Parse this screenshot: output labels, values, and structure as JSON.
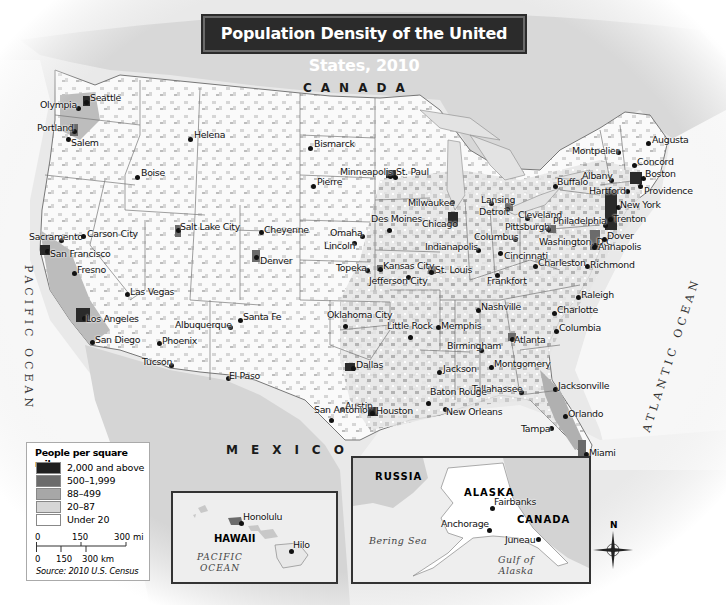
{
  "title": "Population Density of the United States, 2010",
  "countries": {
    "canada": "CANADA",
    "mexico": "MEXICO"
  },
  "oceans": {
    "pacific": "PACIFIC OCEAN",
    "atlantic": "ATLANTIC OCEAN"
  },
  "legend": {
    "title": "People per square mile",
    "items": [
      {
        "label": "2,000 and above",
        "color": "#1f1f1f"
      },
      {
        "label": "500–1,999",
        "color": "#6b6b6b"
      },
      {
        "label": "88–499",
        "color": "#a7a7a7"
      },
      {
        "label": "20–87",
        "color": "#d6d6d6"
      },
      {
        "label": "Under 20",
        "color": "#ffffff"
      }
    ],
    "scale_mi": [
      "0",
      "150",
      "300 mi"
    ],
    "scale_km": [
      "0",
      "150",
      "300 km"
    ],
    "source": "Source: 2010 U.S. Census"
  },
  "cities": [
    {
      "name": "Seattle",
      "x": 86,
      "y": 102,
      "lx": 90,
      "ly": 92
    },
    {
      "name": "Olympia",
      "x": 78,
      "y": 108,
      "lx": 40,
      "ly": 99
    },
    {
      "name": "Portland",
      "x": 74,
      "y": 131,
      "lx": 37,
      "ly": 122
    },
    {
      "name": "Salem",
      "x": 68,
      "y": 139,
      "lx": 71,
      "ly": 137
    },
    {
      "name": "Helena",
      "x": 190,
      "y": 139,
      "lx": 194,
      "ly": 129
    },
    {
      "name": "Boise",
      "x": 137,
      "y": 177,
      "lx": 141,
      "ly": 167
    },
    {
      "name": "Bismarck",
      "x": 310,
      "y": 148,
      "lx": 314,
      "ly": 138
    },
    {
      "name": "Pierre",
      "x": 313,
      "y": 186,
      "lx": 317,
      "ly": 176
    },
    {
      "name": "Minneapolis",
      "x": 390,
      "y": 176,
      "lx": 340,
      "ly": 166
    },
    {
      "name": "St. Paul",
      "x": 395,
      "y": 177,
      "lx": 396,
      "ly": 166
    },
    {
      "name": "Salt Lake City",
      "x": 178,
      "y": 230,
      "lx": 180,
      "ly": 221
    },
    {
      "name": "Sacramento",
      "x": 61,
      "y": 240,
      "lx": 29,
      "ly": 231
    },
    {
      "name": "Carson City",
      "x": 83,
      "y": 236,
      "lx": 87,
      "ly": 228
    },
    {
      "name": "San Francisco",
      "x": 47,
      "y": 251,
      "lx": 50,
      "ly": 248
    },
    {
      "name": "Fresno",
      "x": 74,
      "y": 273,
      "lx": 77,
      "ly": 264
    },
    {
      "name": "Cheyenne",
      "x": 261,
      "y": 232,
      "lx": 264,
      "ly": 224
    },
    {
      "name": "Denver",
      "x": 256,
      "y": 257,
      "lx": 260,
      "ly": 255
    },
    {
      "name": "Omaha",
      "x": 362,
      "y": 236,
      "lx": 330,
      "ly": 227
    },
    {
      "name": "Lincoln",
      "x": 354,
      "y": 243,
      "lx": 324,
      "ly": 240
    },
    {
      "name": "Des Moines",
      "x": 389,
      "y": 230,
      "lx": 371,
      "ly": 213
    },
    {
      "name": "Milwaukee",
      "x": 452,
      "y": 202,
      "lx": 408,
      "ly": 197
    },
    {
      "name": "Chicago",
      "x": 455,
      "y": 224,
      "lx": 422,
      "ly": 218
    },
    {
      "name": "Lansing",
      "x": 491,
      "y": 203,
      "lx": 481,
      "ly": 194
    },
    {
      "name": "Detroit",
      "x": 507,
      "y": 209,
      "lx": 479,
      "ly": 206
    },
    {
      "name": "Cleveland",
      "x": 527,
      "y": 218,
      "lx": 518,
      "ly": 209
    },
    {
      "name": "Buffalo",
      "x": 555,
      "y": 186,
      "lx": 557,
      "ly": 176
    },
    {
      "name": "Montpelier",
      "x": 618,
      "y": 152,
      "lx": 572,
      "ly": 145
    },
    {
      "name": "Augusta",
      "x": 648,
      "y": 143,
      "lx": 652,
      "ly": 134
    },
    {
      "name": "Concord",
      "x": 634,
      "y": 165,
      "lx": 637,
      "ly": 156
    },
    {
      "name": "Albany",
      "x": 611,
      "y": 180,
      "lx": 582,
      "ly": 170
    },
    {
      "name": "Boston",
      "x": 643,
      "y": 178,
      "lx": 645,
      "ly": 168
    },
    {
      "name": "Hartford",
      "x": 627,
      "y": 191,
      "lx": 589,
      "ly": 185
    },
    {
      "name": "Providence",
      "x": 640,
      "y": 186,
      "lx": 644,
      "ly": 185
    },
    {
      "name": "New York",
      "x": 618,
      "y": 207,
      "lx": 620,
      "ly": 199
    },
    {
      "name": "Trenton",
      "x": 610,
      "y": 219,
      "lx": 613,
      "ly": 213
    },
    {
      "name": "Philadelphia",
      "x": 605,
      "y": 225,
      "lx": 553,
      "ly": 215
    },
    {
      "name": "Pittsburgh",
      "x": 548,
      "y": 229,
      "lx": 505,
      "ly": 221
    },
    {
      "name": "Columbus",
      "x": 515,
      "y": 239,
      "lx": 474,
      "ly": 231
    },
    {
      "name": "Indianapolis",
      "x": 478,
      "y": 250,
      "lx": 425,
      "ly": 241
    },
    {
      "name": "Cincinnati",
      "x": 500,
      "y": 253,
      "lx": 504,
      "ly": 250
    },
    {
      "name": "Washington, D.C.",
      "x": 595,
      "y": 245,
      "lx": 539,
      "ly": 236
    },
    {
      "name": "Dover",
      "x": 604,
      "y": 239,
      "lx": 607,
      "ly": 230
    },
    {
      "name": "Annapolis",
      "x": 594,
      "y": 247,
      "lx": 598,
      "ly": 241
    },
    {
      "name": "Charleston",
      "x": 535,
      "y": 266,
      "lx": 538,
      "ly": 257
    },
    {
      "name": "Richmond",
      "x": 587,
      "y": 266,
      "lx": 590,
      "ly": 259
    },
    {
      "name": "Topeka",
      "x": 367,
      "y": 270,
      "lx": 336,
      "ly": 262
    },
    {
      "name": "Kansas City",
      "x": 380,
      "y": 269,
      "lx": 383,
      "ly": 260
    },
    {
      "name": "Jefferson City",
      "x": 408,
      "y": 277,
      "lx": 369,
      "ly": 275
    },
    {
      "name": "St. Louis",
      "x": 431,
      "y": 272,
      "lx": 435,
      "ly": 264
    },
    {
      "name": "Frankfort",
      "x": 497,
      "y": 275,
      "lx": 487,
      "ly": 275
    },
    {
      "name": "Las Vegas",
      "x": 127,
      "y": 294,
      "lx": 130,
      "ly": 286
    },
    {
      "name": "Santa Fe",
      "x": 240,
      "y": 320,
      "lx": 243,
      "ly": 311
    },
    {
      "name": "Albuquerque",
      "x": 230,
      "y": 327,
      "lx": 175,
      "ly": 319
    },
    {
      "name": "Los Angeles",
      "x": 84,
      "y": 318,
      "lx": 86,
      "ly": 313
    },
    {
      "name": "San Diego",
      "x": 92,
      "y": 342,
      "lx": 95,
      "ly": 334
    },
    {
      "name": "Phoenix",
      "x": 159,
      "y": 343,
      "lx": 162,
      "ly": 335
    },
    {
      "name": "Tucson",
      "x": 171,
      "y": 365,
      "lx": 142,
      "ly": 356
    },
    {
      "name": "El Paso",
      "x": 228,
      "y": 378,
      "lx": 229,
      "ly": 370
    },
    {
      "name": "Oklahoma City",
      "x": 345,
      "y": 326,
      "lx": 327,
      "ly": 309
    },
    {
      "name": "Little Rock",
      "x": 410,
      "y": 337,
      "lx": 387,
      "ly": 320
    },
    {
      "name": "Memphis",
      "x": 438,
      "y": 327,
      "lx": 441,
      "ly": 320
    },
    {
      "name": "Nashville",
      "x": 478,
      "y": 310,
      "lx": 481,
      "ly": 301
    },
    {
      "name": "Raleigh",
      "x": 578,
      "y": 297,
      "lx": 581,
      "ly": 289
    },
    {
      "name": "Charlotte",
      "x": 554,
      "y": 313,
      "lx": 557,
      "ly": 304
    },
    {
      "name": "Columbia",
      "x": 556,
      "y": 331,
      "lx": 559,
      "ly": 322
    },
    {
      "name": "Atlanta",
      "x": 512,
      "y": 339,
      "lx": 514,
      "ly": 334
    },
    {
      "name": "Birmingham",
      "x": 481,
      "y": 350,
      "lx": 447,
      "ly": 340
    },
    {
      "name": "Montgomery",
      "x": 491,
      "y": 367,
      "lx": 494,
      "ly": 358
    },
    {
      "name": "Jackson",
      "x": 439,
      "y": 372,
      "lx": 443,
      "ly": 363
    },
    {
      "name": "Dallas",
      "x": 353,
      "y": 368,
      "lx": 356,
      "ly": 359
    },
    {
      "name": "Tallahassee",
      "x": 521,
      "y": 392,
      "lx": 472,
      "ly": 383
    },
    {
      "name": "Jacksonville",
      "x": 555,
      "y": 389,
      "lx": 558,
      "ly": 380
    },
    {
      "name": "Baton Rouge",
      "x": 428,
      "y": 403,
      "lx": 430,
      "ly": 386
    },
    {
      "name": "New Orleans",
      "x": 445,
      "y": 409,
      "lx": 446,
      "ly": 406
    },
    {
      "name": "Austin",
      "x": 342,
      "y": 409,
      "lx": 345,
      "ly": 400
    },
    {
      "name": "San Antonio",
      "x": 331,
      "y": 420,
      "lx": 314,
      "ly": 404
    },
    {
      "name": "Houston",
      "x": 372,
      "y": 413,
      "lx": 376,
      "ly": 405
    },
    {
      "name": "Orlando",
      "x": 565,
      "y": 416,
      "lx": 568,
      "ly": 408
    },
    {
      "name": "Tampa",
      "x": 551,
      "y": 428,
      "lx": 521,
      "ly": 423
    },
    {
      "name": "Miami",
      "x": 586,
      "y": 454,
      "lx": 589,
      "ly": 447
    }
  ],
  "insets": {
    "hawaii": {
      "label": "HAWAII",
      "ocean": "PACIFIC OCEAN",
      "cities": [
        {
          "name": "Honolulu",
          "x": 68,
          "y": 30,
          "lx": 71,
          "ly": 18
        },
        {
          "name": "Hilo",
          "x": 118,
          "y": 57,
          "lx": 121,
          "ly": 46
        }
      ]
    },
    "alaska": {
      "label": "ALASKA",
      "russia": "RUSSIA",
      "canada": "CANADA",
      "bering": "Bering Sea",
      "gulf": "Gulf of Alaska",
      "cities": [
        {
          "name": "Fairbanks",
          "x": 139,
          "y": 49,
          "lx": 142,
          "ly": 38
        },
        {
          "name": "Anchorage",
          "x": 136,
          "y": 71,
          "lx": 88,
          "ly": 60
        },
        {
          "name": "Juneau",
          "x": 185,
          "y": 80,
          "lx": 153,
          "ly": 76
        }
      ]
    }
  },
  "compass": {
    "label": "N"
  }
}
